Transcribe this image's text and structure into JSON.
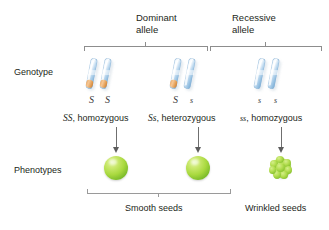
{
  "figure": {
    "row_labels": {
      "genotype": "Genotype",
      "phenotypes": "Phenotypes"
    },
    "allele_headers": [
      {
        "line1": "Dominant",
        "line2": "allele"
      },
      {
        "line1": "Recessive",
        "line2": "allele"
      }
    ],
    "genotypes": [
      {
        "allele_symbols": [
          "S",
          "S"
        ],
        "allele_cases": [
          "upper",
          "upper"
        ],
        "band_colors": [
          "#e09a50",
          "#e09a50"
        ],
        "description_symbol": "SS",
        "description_text": ", homozygous"
      },
      {
        "allele_symbols": [
          "S",
          "s"
        ],
        "allele_cases": [
          "upper",
          "lower"
        ],
        "band_colors": [
          "#e09a50",
          "#8e4f77"
        ],
        "description_symbol": "Ss",
        "description_text": ", heterozygous"
      },
      {
        "allele_symbols": [
          "s",
          "s"
        ],
        "allele_cases": [
          "lower",
          "lower"
        ],
        "band_colors": [
          "#8e4f77",
          "#8e4f77"
        ],
        "description_symbol": "ss",
        "description_text": ", homozygous"
      }
    ],
    "phenotypes": [
      {
        "seed_type": "smooth"
      },
      {
        "seed_type": "smooth"
      },
      {
        "seed_type": "wrinkled"
      }
    ],
    "phenotype_labels": [
      "Smooth seeds",
      "Wrinkled seeds"
    ],
    "colors": {
      "chromosome": "#a8cbe6",
      "dominant_band": "#e09a50",
      "recessive_band": "#8e4f77",
      "seed_green": "#a9d93f",
      "bracket_gray": "#8d8d8d",
      "arrow_gray": "#5d5d5d",
      "text": "#231f20",
      "background": "#ffffff"
    }
  }
}
